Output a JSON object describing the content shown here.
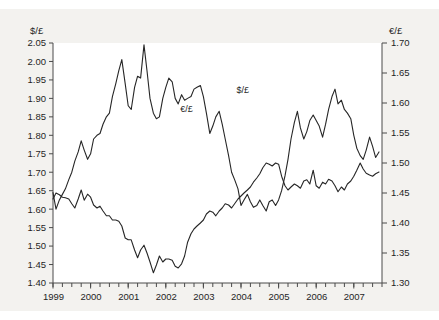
{
  "chart_data": {
    "type": "line",
    "title": "",
    "subtitle": "",
    "xlabel": "",
    "ylabel": "$/£",
    "y2label": "€/£",
    "grid": false,
    "legend_position": "inline-annotations",
    "xlim": [
      1999.0,
      2007.75
    ],
    "ylim": [
      1.4,
      2.05
    ],
    "y2lim": [
      1.3,
      1.7
    ],
    "x_tick_labels": [
      "1999",
      "2000",
      "2001",
      "2002",
      "2003",
      "2004",
      "2005",
      "2006",
      "2007"
    ],
    "x_tick_values": [
      1999,
      2000,
      2001,
      2002,
      2003,
      2004,
      2005,
      2006,
      2007
    ],
    "x_minor_tick_interval": 0.25,
    "y_tick_labels": [
      "1.40",
      "1.45",
      "1.50",
      "1.55",
      "1.60",
      "1.65",
      "1.70",
      "1.75",
      "1.80",
      "1.85",
      "1.90",
      "1.95",
      "2.00",
      "2.05"
    ],
    "y_tick_values": [
      1.4,
      1.45,
      1.5,
      1.55,
      1.6,
      1.65,
      1.7,
      1.75,
      1.8,
      1.85,
      1.9,
      1.95,
      2.0,
      2.05
    ],
    "y2_tick_labels": [
      "1.30",
      "1.35",
      "1.40",
      "1.45",
      "1.50",
      "1.55",
      "1.60",
      "1.65",
      "1.70"
    ],
    "y2_tick_values": [
      1.3,
      1.35,
      1.4,
      1.45,
      1.5,
      1.55,
      1.6,
      1.65,
      1.7
    ],
    "annotations": [
      {
        "text": "€/£",
        "x": 2002.55,
        "y_axis": "right",
        "value": 1.585
      },
      {
        "text": "$/£",
        "x": 2004.05,
        "y_axis": "left",
        "value": 1.915
      }
    ],
    "series": [
      {
        "name": "$/£",
        "axis": "left",
        "color": "#262626",
        "x": [
          1999.0,
          1999.08,
          1999.17,
          1999.25,
          1999.33,
          1999.42,
          1999.5,
          1999.58,
          1999.67,
          1999.75,
          1999.83,
          1999.92,
          2000.0,
          2000.08,
          2000.17,
          2000.25,
          2000.33,
          2000.42,
          2000.5,
          2000.58,
          2000.67,
          2000.75,
          2000.83,
          2000.92,
          2001.0,
          2001.08,
          2001.17,
          2001.25,
          2001.33,
          2001.42,
          2001.5,
          2001.58,
          2001.67,
          2001.75,
          2001.83,
          2001.92,
          2002.0,
          2002.08,
          2002.17,
          2002.25,
          2002.33,
          2002.42,
          2002.5,
          2002.58,
          2002.67,
          2002.75,
          2002.83,
          2002.92,
          2003.0,
          2003.08,
          2003.17,
          2003.25,
          2003.33,
          2003.42,
          2003.5,
          2003.58,
          2003.67,
          2003.75,
          2003.83,
          2003.92,
          2004.0,
          2004.08,
          2004.17,
          2004.25,
          2004.33,
          2004.42,
          2004.5,
          2004.58,
          2004.67,
          2004.75,
          2004.83,
          2004.92,
          2005.0,
          2005.08,
          2005.17,
          2005.25,
          2005.33,
          2005.42,
          2005.5,
          2005.58,
          2005.67,
          2005.75,
          2005.83,
          2005.92,
          2006.0,
          2006.08,
          2006.17,
          2006.25,
          2006.33,
          2006.42,
          2006.5,
          2006.58,
          2006.67,
          2006.75,
          2006.83,
          2006.92,
          2007.0,
          2007.08,
          2007.17,
          2007.25,
          2007.33,
          2007.42,
          2007.5,
          2007.58,
          2007.67
        ],
        "values": [
          1.645,
          1.6,
          1.625,
          1.64,
          1.655,
          1.68,
          1.7,
          1.73,
          1.755,
          1.785,
          1.76,
          1.735,
          1.75,
          1.79,
          1.8,
          1.805,
          1.83,
          1.85,
          1.86,
          1.905,
          1.94,
          1.975,
          2.005,
          1.94,
          1.88,
          1.87,
          1.93,
          1.96,
          1.955,
          2.045,
          1.975,
          1.9,
          1.86,
          1.845,
          1.85,
          1.9,
          1.93,
          1.955,
          1.945,
          1.9,
          1.885,
          1.91,
          1.895,
          1.9,
          1.905,
          1.925,
          1.93,
          1.935,
          1.905,
          1.86,
          1.805,
          1.825,
          1.85,
          1.865,
          1.83,
          1.79,
          1.745,
          1.7,
          1.68,
          1.655,
          1.61,
          1.625,
          1.64,
          1.62,
          1.605,
          1.61,
          1.625,
          1.61,
          1.595,
          1.62,
          1.625,
          1.61,
          1.625,
          1.65,
          1.69,
          1.735,
          1.79,
          1.835,
          1.865,
          1.82,
          1.79,
          1.81,
          1.84,
          1.855,
          1.84,
          1.825,
          1.795,
          1.83,
          1.87,
          1.905,
          1.925,
          1.885,
          1.895,
          1.87,
          1.86,
          1.845,
          1.8,
          1.765,
          1.745,
          1.735,
          1.76,
          1.795,
          1.77,
          1.74,
          1.755
        ]
      },
      {
        "name": "€/£",
        "axis": "right",
        "color": "#262626",
        "x": [
          1999.0,
          1999.08,
          1999.17,
          1999.25,
          1999.33,
          1999.42,
          1999.5,
          1999.58,
          1999.67,
          1999.75,
          1999.83,
          1999.92,
          2000.0,
          2000.08,
          2000.17,
          2000.25,
          2000.33,
          2000.42,
          2000.5,
          2000.58,
          2000.67,
          2000.75,
          2000.83,
          2000.92,
          2001.0,
          2001.08,
          2001.17,
          2001.25,
          2001.33,
          2001.42,
          2001.5,
          2001.58,
          2001.67,
          2001.75,
          2001.83,
          2001.92,
          2002.0,
          2002.08,
          2002.17,
          2002.25,
          2002.33,
          2002.42,
          2002.5,
          2002.58,
          2002.67,
          2002.75,
          2002.83,
          2002.92,
          2003.0,
          2003.08,
          2003.17,
          2003.25,
          2003.33,
          2003.42,
          2003.5,
          2003.58,
          2003.67,
          2003.75,
          2003.83,
          2003.92,
          2004.0,
          2004.08,
          2004.17,
          2004.25,
          2004.33,
          2004.42,
          2004.5,
          2004.58,
          2004.67,
          2004.75,
          2004.83,
          2004.92,
          2005.0,
          2005.08,
          2005.17,
          2005.25,
          2005.33,
          2005.42,
          2005.5,
          2005.58,
          2005.67,
          2005.75,
          2005.83,
          2005.92,
          2006.0,
          2006.08,
          2006.17,
          2006.25,
          2006.33,
          2006.42,
          2006.5,
          2006.58,
          2006.67,
          2006.75,
          2006.83,
          2006.92,
          2007.0,
          2007.08,
          2007.17,
          2007.25,
          2007.33,
          2007.42,
          2007.5,
          2007.58,
          2007.67
        ],
        "values": [
          1.44,
          1.45,
          1.447,
          1.443,
          1.442,
          1.44,
          1.432,
          1.425,
          1.44,
          1.455,
          1.438,
          1.448,
          1.443,
          1.43,
          1.425,
          1.428,
          1.42,
          1.412,
          1.412,
          1.405,
          1.405,
          1.403,
          1.395,
          1.375,
          1.372,
          1.372,
          1.355,
          1.342,
          1.355,
          1.363,
          1.35,
          1.335,
          1.317,
          1.33,
          1.345,
          1.335,
          1.34,
          1.34,
          1.338,
          1.328,
          1.325,
          1.332,
          1.345,
          1.368,
          1.382,
          1.39,
          1.395,
          1.4,
          1.405,
          1.415,
          1.42,
          1.418,
          1.412,
          1.42,
          1.425,
          1.432,
          1.43,
          1.425,
          1.432,
          1.44,
          1.445,
          1.45,
          1.455,
          1.46,
          1.468,
          1.475,
          1.482,
          1.492,
          1.5,
          1.498,
          1.495,
          1.5,
          1.498,
          1.478,
          1.462,
          1.455,
          1.46,
          1.465,
          1.462,
          1.458,
          1.47,
          1.472,
          1.465,
          1.488,
          1.462,
          1.458,
          1.468,
          1.465,
          1.473,
          1.47,
          1.462,
          1.452,
          1.46,
          1.455,
          1.465,
          1.47,
          1.478,
          1.488,
          1.5,
          1.49,
          1.483,
          1.48,
          1.478,
          1.482,
          1.485
        ]
      }
    ]
  },
  "plot": {
    "left_axis_title": "$/£",
    "right_axis_title": "€/£"
  }
}
